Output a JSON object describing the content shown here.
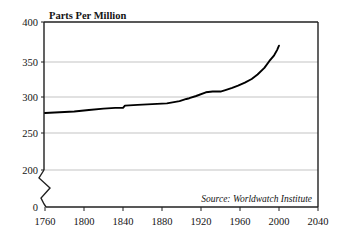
{
  "chart_data": {
    "type": "line",
    "title": "",
    "ylabel": "Parts Per Million",
    "xlabel": "",
    "xlim": [
      1760,
      2040
    ],
    "ylim": [
      200,
      400
    ],
    "y_axis_break": true,
    "y_break_label": "0",
    "grid": true,
    "grid_color": "#b4b4b4",
    "line_color": "#000000",
    "legend": "none",
    "annotation": "Source: Worldwatch Institute",
    "xticks": [
      "1760",
      "1800",
      "1840",
      "1880",
      "1920",
      "1960",
      "2000",
      "2040"
    ],
    "xtick_values": [
      1760,
      1800,
      1840,
      1880,
      1920,
      1960,
      2000,
      2040
    ],
    "yticks": [
      "400",
      "350",
      "300",
      "250",
      "200",
      "0"
    ],
    "ytick_values": [
      400,
      350,
      300,
      250,
      200,
      0
    ],
    "series": [
      {
        "name": "Atmospheric Carbon Dioxide Concentration",
        "x": [
          1760,
          1775,
          1790,
          1805,
          1820,
          1832,
          1840,
          1842,
          1855,
          1870,
          1885,
          1898,
          1905,
          1908,
          1915,
          1925,
          1932,
          1940,
          1945,
          1952,
          1958,
          1965,
          1972,
          1978,
          1985,
          1990,
          1995,
          1998,
          2000
        ],
        "values": [
          277,
          278,
          279,
          281,
          283,
          284,
          284,
          287,
          288,
          289,
          290,
          293,
          296,
          297,
          300,
          305,
          306,
          306,
          308,
          311,
          314,
          318,
          323,
          329,
          338,
          347,
          355,
          362,
          368
        ]
      }
    ]
  }
}
